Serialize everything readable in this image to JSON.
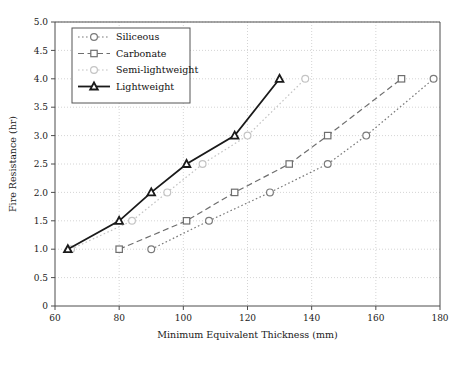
{
  "chart_data": {
    "type": "line",
    "title": "",
    "xlabel": "Minimum Equivalent Thickness (mm)",
    "ylabel": "Fire Resistance (hr)",
    "xlim": [
      60,
      180
    ],
    "ylim": [
      0,
      5.0
    ],
    "xticks": [
      "60",
      "80",
      "100",
      "120",
      "140",
      "160",
      "180"
    ],
    "xtick_values": [
      60,
      80,
      100,
      120,
      140,
      160,
      180
    ],
    "yticks": [
      "0",
      "0.5",
      "1.0",
      "1.5",
      "2.0",
      "2.5",
      "3.0",
      "3.5",
      "4.0",
      "4.5",
      "5.0"
    ],
    "ytick_values": [
      0,
      0.5,
      1.0,
      1.5,
      2.0,
      2.5,
      3.0,
      3.5,
      4.0,
      4.5,
      5.0
    ],
    "grid": true,
    "legend_position": "upper left",
    "series": [
      {
        "name": "Siliceous",
        "marker": "circle",
        "linestyle": "dotted",
        "color": "#7a7a7a",
        "x": [
          90,
          108,
          127,
          145,
          157,
          178
        ],
        "y": [
          1.0,
          1.5,
          2.0,
          2.5,
          3.0,
          4.0
        ]
      },
      {
        "name": "Carbonate",
        "marker": "square",
        "linestyle": "dashed",
        "color": "#6e6e6e",
        "x": [
          80,
          101,
          116,
          133,
          145,
          168
        ],
        "y": [
          1.0,
          1.5,
          2.0,
          2.5,
          3.0,
          4.0
        ]
      },
      {
        "name": "Semi-lightweight",
        "marker": "circle",
        "linestyle": "dotted",
        "color": "#c4c4c4",
        "x": [
          65,
          84,
          95,
          106,
          120,
          138
        ],
        "y": [
          1.0,
          1.5,
          2.0,
          2.5,
          3.0,
          4.0
        ]
      },
      {
        "name": "Lightweight",
        "marker": "triangle",
        "linestyle": "solid",
        "color": "#1a1a1a",
        "x": [
          64,
          80,
          90,
          101,
          116,
          130
        ],
        "y": [
          1.0,
          1.5,
          2.0,
          2.5,
          3.0,
          4.0
        ]
      }
    ]
  },
  "legend": {
    "items": [
      {
        "label": "Siliceous"
      },
      {
        "label": "Carbonate"
      },
      {
        "label": "Semi-lightweight"
      },
      {
        "label": "Lightweight"
      }
    ]
  },
  "colors": {
    "axis": "#4d4d4d",
    "grid": "#c9c9c9",
    "text": "#1a1a1a",
    "background": "#ffffff"
  }
}
